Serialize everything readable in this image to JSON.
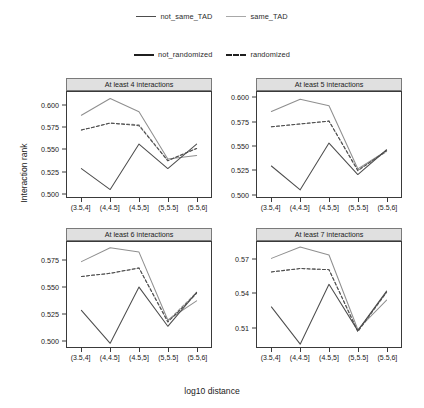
{
  "legends": {
    "tad": {
      "items": [
        {
          "label": "not_same_TAD",
          "key": "solid-dark",
          "color": "#4d4d4d"
        },
        {
          "label": "same_TAD",
          "key": "solid-light",
          "color": "#a8a8a8"
        }
      ]
    },
    "randomization": {
      "items": [
        {
          "label": "not_randomized",
          "key": "solid-black",
          "color": "#1f1f1f"
        },
        {
          "label": "randomized",
          "key": "dashed-black",
          "color": "#1f1f1f"
        }
      ]
    }
  },
  "axis_titles": {
    "x": "log10 distance",
    "y": "Interaction rank"
  },
  "chart_data": {
    "type": "line",
    "title": "",
    "xlabel": "log10 distance",
    "ylabel": "Interaction rank",
    "grid": false,
    "legend_position": "top",
    "categories": [
      "(3.5,4]",
      "(4,4.5]",
      "(4.5,5]",
      "(5,5.5]",
      "(5.5,6]"
    ],
    "panels": [
      {
        "title": "At least 4 interactions",
        "ylim": [
          0.4955,
          0.6155
        ],
        "yticks": [
          0.5,
          0.525,
          0.55,
          0.575,
          0.6
        ],
        "ytick_labels": [
          "0.500",
          "0.525",
          "0.550",
          "0.575",
          "0.600"
        ],
        "series": [
          {
            "name": "same_TAD not_randomized",
            "tad": "same_TAD",
            "randomized": false,
            "color": "#8f8f8f",
            "dash": false,
            "values": [
              0.589,
              0.608,
              0.593,
              0.539,
              0.543
            ]
          },
          {
            "name": "same_TAD randomized",
            "tad": "same_TAD",
            "randomized": true,
            "color": "#8f8f8f",
            "dash": true,
            "values": [
              0.572,
              0.58,
              0.578,
              0.537,
              0.551
            ]
          },
          {
            "name": "not_same_TAD not_randomized",
            "tad": "not_same_TAD",
            "randomized": false,
            "color": "#4d4d4d",
            "dash": false,
            "values": [
              0.528,
              0.504,
              0.556,
              0.528,
              0.556
            ]
          },
          {
            "name": "not_same_TAD randomized",
            "tad": "not_same_TAD",
            "randomized": true,
            "color": "#4d4d4d",
            "dash": true,
            "values": [
              0.572,
              0.58,
              0.577,
              0.537,
              0.551
            ]
          }
        ]
      },
      {
        "title": "At least 5 interactions",
        "ylim": [
          0.4965,
          0.6065
        ],
        "yticks": [
          0.5,
          0.525,
          0.55,
          0.575,
          0.6
        ],
        "ytick_labels": [
          "0.500",
          "0.525",
          "0.550",
          "0.575",
          "0.600"
        ],
        "series": [
          {
            "name": "same_TAD not_randomized",
            "tad": "same_TAD",
            "randomized": false,
            "color": "#8f8f8f",
            "dash": false,
            "values": [
              0.586,
              0.599,
              0.592,
              0.526,
              0.545
            ]
          },
          {
            "name": "same_TAD randomized",
            "tad": "same_TAD",
            "randomized": true,
            "color": "#8f8f8f",
            "dash": true,
            "values": [
              0.57,
              0.573,
              0.576,
              0.525,
              0.544
            ]
          },
          {
            "name": "not_same_TAD not_randomized",
            "tad": "not_same_TAD",
            "randomized": false,
            "color": "#4d4d4d",
            "dash": false,
            "values": [
              0.529,
              0.504,
              0.553,
              0.52,
              0.546
            ]
          },
          {
            "name": "not_same_TAD randomized",
            "tad": "not_same_TAD",
            "randomized": true,
            "color": "#4d4d4d",
            "dash": true,
            "values": [
              0.57,
              0.573,
              0.576,
              0.524,
              0.545
            ]
          }
        ]
      },
      {
        "title": "At least 6 interactions",
        "ylim": [
          0.4935,
          0.5925
        ],
        "yticks": [
          0.5,
          0.525,
          0.55,
          0.575
        ],
        "ytick_labels": [
          "0.500",
          "0.525",
          "0.550",
          "0.575"
        ],
        "series": [
          {
            "name": "same_TAD not_randomized",
            "tad": "same_TAD",
            "randomized": false,
            "color": "#8f8f8f",
            "dash": false,
            "values": [
              0.574,
              0.587,
              0.583,
              0.519,
              0.537
            ]
          },
          {
            "name": "same_TAD randomized",
            "tad": "same_TAD",
            "randomized": true,
            "color": "#8f8f8f",
            "dash": true,
            "values": [
              0.56,
              0.563,
              0.568,
              0.518,
              0.545
            ]
          },
          {
            "name": "not_same_TAD not_randomized",
            "tad": "not_same_TAD",
            "randomized": false,
            "color": "#4d4d4d",
            "dash": false,
            "values": [
              0.528,
              0.497,
              0.55,
              0.513,
              0.545
            ]
          },
          {
            "name": "not_same_TAD randomized",
            "tad": "not_same_TAD",
            "randomized": true,
            "color": "#4d4d4d",
            "dash": true,
            "values": [
              0.56,
              0.563,
              0.568,
              0.517,
              0.544
            ]
          }
        ]
      },
      {
        "title": "At least 7 interactions",
        "ylim": [
          0.4925,
          0.5855
        ],
        "yticks": [
          0.51,
          0.54,
          0.57
        ],
        "ytick_labels": [
          "0.51",
          "0.54",
          "0.57"
        ],
        "series": [
          {
            "name": "same_TAD not_randomized",
            "tad": "same_TAD",
            "randomized": false,
            "color": "#8f8f8f",
            "dash": false,
            "values": [
              0.571,
              0.581,
              0.574,
              0.508,
              0.534
            ]
          },
          {
            "name": "same_TAD randomized",
            "tad": "same_TAD",
            "randomized": true,
            "color": "#8f8f8f",
            "dash": true,
            "values": [
              0.559,
              0.562,
              0.561,
              0.507,
              0.541
            ]
          },
          {
            "name": "not_same_TAD not_randomized",
            "tad": "not_same_TAD",
            "randomized": false,
            "color": "#4d4d4d",
            "dash": false,
            "values": [
              0.528,
              0.495,
              0.548,
              0.507,
              0.542
            ]
          },
          {
            "name": "not_same_TAD randomized",
            "tad": "not_same_TAD",
            "randomized": true,
            "color": "#4d4d4d",
            "dash": true,
            "values": [
              0.559,
              0.562,
              0.561,
              0.506,
              0.541
            ]
          }
        ]
      }
    ]
  }
}
